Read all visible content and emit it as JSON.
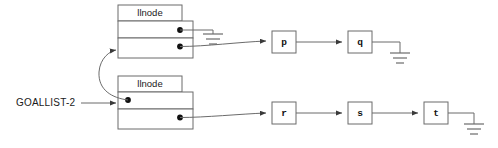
{
  "diagram": {
    "colors": {
      "background": "#ffffff",
      "stroke": "#6b6b6b",
      "dot": "#111111",
      "text": "#1a1a1a"
    },
    "root_pointer": {
      "label": "GOALLIST-2"
    },
    "nodes": [
      {
        "id": "node-upper",
        "title": "llnode",
        "car_label": "",
        "cdr_label": ""
      },
      {
        "id": "node-lower",
        "title": "llnode",
        "car_label": "",
        "cdr_label": ""
      }
    ],
    "atoms_upper": [
      {
        "id": "atom-p",
        "label": "p"
      },
      {
        "id": "atom-q",
        "label": "q"
      }
    ],
    "atoms_lower": [
      {
        "id": "atom-r",
        "label": "r"
      },
      {
        "id": "atom-s",
        "label": "s"
      },
      {
        "id": "atom-t",
        "label": "t"
      }
    ],
    "terminators": [
      {
        "id": "ground-upper-car",
        "label": ""
      },
      {
        "id": "ground-q",
        "label": ""
      },
      {
        "id": "ground-t",
        "label": ""
      }
    ]
  }
}
